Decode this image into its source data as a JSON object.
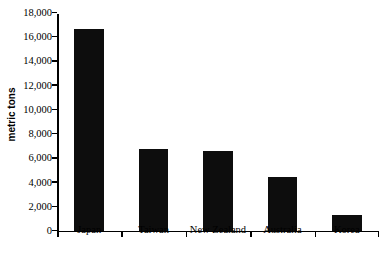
{
  "chart_data": {
    "type": "bar",
    "title": "",
    "subtitle": "",
    "xlabel": "",
    "ylabel": "metric tons",
    "categories": [
      "Japan",
      "Taiwan",
      "New Zealand",
      "Australia",
      "Korea"
    ],
    "values": [
      16600,
      6750,
      6600,
      4400,
      1300
    ],
    "series": [
      {
        "name": "metric tons",
        "values": [
          16600,
          6750,
          6600,
          4400,
          1300
        ]
      }
    ],
    "ylim": [
      0,
      18000
    ],
    "ytick_values": [
      0,
      2000,
      4000,
      6000,
      8000,
      10000,
      12000,
      14000,
      16000,
      18000
    ],
    "ytick_labels": [
      "0",
      "2,000",
      "4,000",
      "6,000",
      "8,000",
      "10,000",
      "12,000",
      "14,000",
      "16,000",
      "18,000"
    ],
    "grid": false,
    "legend": false,
    "legend_position": "none",
    "bar_color": "#0d0d0d",
    "axis_color": "#000000",
    "background_color": "#ffffff"
  }
}
